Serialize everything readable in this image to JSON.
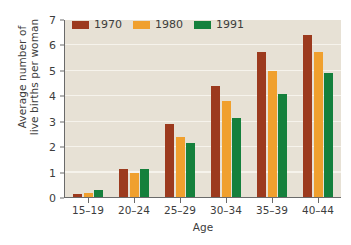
{
  "chart_data": {
    "type": "bar",
    "title": "",
    "xlabel": "Age",
    "ylabel": "Average number of live births per woman",
    "ylabel_lines": [
      "Average number of",
      "live births per woman"
    ],
    "categories": [
      "15–19",
      "20–24",
      "25–29",
      "30–34",
      "35–39",
      "40–44"
    ],
    "series": [
      {
        "name": "1970",
        "color": "#9C3A1E",
        "values": [
          0.15,
          1.15,
          2.9,
          4.4,
          5.75,
          6.4
        ]
      },
      {
        "name": "1980",
        "color": "#F0A02E",
        "values": [
          0.2,
          1.0,
          2.4,
          3.8,
          5.0,
          5.75
        ]
      },
      {
        "name": "1991",
        "color": "#15803C",
        "values": [
          0.3,
          1.15,
          2.15,
          3.15,
          4.1,
          4.9
        ]
      }
    ],
    "ylim": [
      0,
      7
    ],
    "yticks": [
      0,
      1,
      2,
      3,
      4,
      5,
      6,
      7
    ],
    "ytick_labels": [
      "0",
      "1",
      "2",
      "3",
      "4",
      "5",
      "6",
      "7"
    ],
    "grid": true,
    "grid_axis": "y",
    "legend_position": "top-left",
    "plot_background": "#e7e1d5",
    "gridline_color": "#f6f3ec",
    "axis_color": "#6a6a6a",
    "figure_background": "#ffffff"
  }
}
